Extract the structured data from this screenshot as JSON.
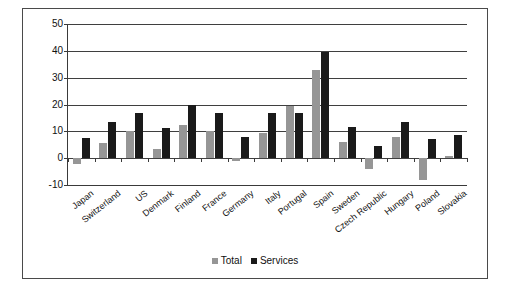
{
  "chart_data": {
    "type": "bar",
    "title": "",
    "subtitle": "",
    "xlabel": "",
    "ylabel": "",
    "ylim": [
      -10,
      50
    ],
    "yticks": [
      50,
      40,
      30,
      20,
      10,
      0,
      -10
    ],
    "ytick_labels": [
      "50",
      "40",
      "30",
      "20",
      "10",
      "0",
      "-10"
    ],
    "grid": true,
    "legend_position": "bottom-center",
    "categories": [
      "Japan",
      "Switzerland",
      "US",
      "Denmark",
      "Finland",
      "France",
      "Germany",
      "Italy",
      "Portugal",
      "Spain",
      "Sweden",
      "Czech Republic",
      "Hungary",
      "Poland",
      "Slovakia"
    ],
    "series": [
      {
        "name": "Total",
        "color": "#969696",
        "values": [
          -2.0,
          5.5,
          10.0,
          3.5,
          12.5,
          10.2,
          -1.0,
          9.5,
          19.5,
          33.0,
          6.0,
          -4.0,
          8.0,
          -8.0,
          0.7
        ]
      },
      {
        "name": "Services",
        "color": "#1a1a1a",
        "values": [
          7.5,
          13.5,
          17.0,
          11.2,
          20.0,
          16.7,
          8.0,
          16.7,
          17.0,
          39.5,
          11.5,
          4.5,
          13.5,
          7.0,
          8.5
        ]
      }
    ]
  },
  "legend": {
    "items": [
      {
        "label": "Total",
        "swatch": "total-swatch"
      },
      {
        "label": "Services",
        "swatch": "services-swatch"
      }
    ]
  }
}
